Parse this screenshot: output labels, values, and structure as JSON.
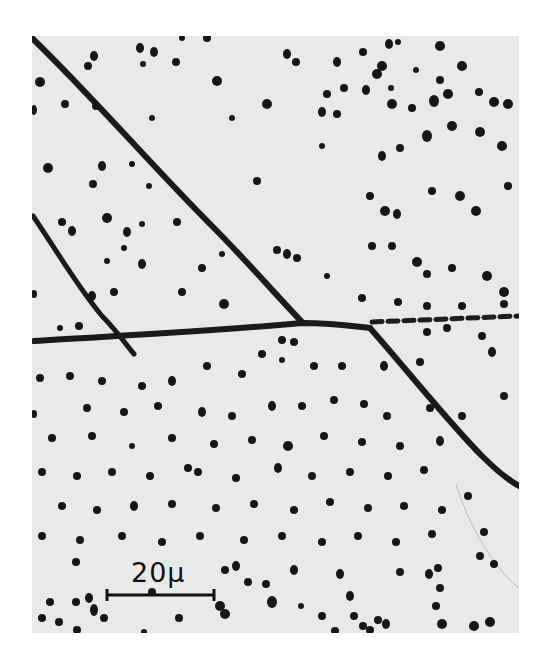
{
  "figure": {
    "kind": "optical micrograph",
    "scale_bar": {
      "label": "20μ",
      "value": 20,
      "unit": "μ"
    }
  },
  "colors": {
    "background": "#ffffff",
    "field": "#e9e9e9",
    "pits": "#161616",
    "boundaries": "#1a1a1a"
  }
}
